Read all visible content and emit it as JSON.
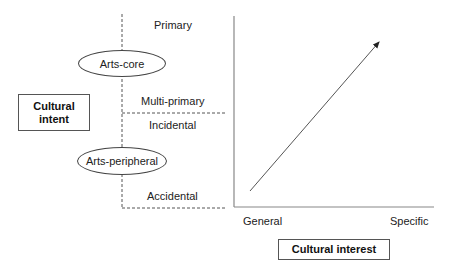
{
  "left_panel": {
    "axis_label": "Cultural\nintent",
    "axis_label_line1": "Cultural",
    "axis_label_line2": "intent",
    "nodes": [
      {
        "label": "Arts-core"
      },
      {
        "label": "Arts-peripheral"
      }
    ],
    "categories": [
      {
        "label": "Primary"
      },
      {
        "label": "Multi-primary"
      },
      {
        "label": "Incidental"
      },
      {
        "label": "Accidental"
      }
    ]
  },
  "right_panel": {
    "x_axis_label": "Cultural interest",
    "x_ticks": [
      {
        "label": "General"
      },
      {
        "label": "Specific"
      }
    ],
    "trend": "increasing arrow from lower-left to upper-right"
  },
  "colors": {
    "line": "#444444",
    "axis": "#888888",
    "text": "#222222",
    "background": "#ffffff"
  }
}
